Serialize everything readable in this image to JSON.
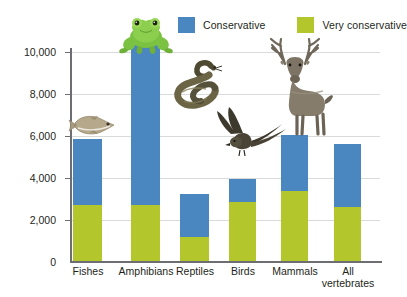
{
  "chart_data": {
    "type": "bar",
    "title": "",
    "subtitle": "",
    "xlabel": "",
    "ylabel": "Number of years",
    "ylim": [
      0,
      11000
    ],
    "yticks": [
      0,
      2000,
      4000,
      6000,
      8000,
      10000
    ],
    "ytick_labels": [
      "0",
      "2,000",
      "4,000",
      "6,000",
      "8,000",
      "10,000"
    ],
    "grid": true,
    "stacked": true,
    "legend_position": "top-right",
    "categories": [
      "Fishes",
      "Amphibians",
      "Reptiles",
      "Birds",
      "Mammals",
      "All vertebrates"
    ],
    "series": [
      {
        "name": "Very conservative",
        "color": "#b3c62c",
        "values": [
          2650,
          2650,
          1150,
          2800,
          3350,
          2550
        ]
      },
      {
        "name": "Conservative",
        "color": "#4a86c0",
        "values": [
          3150,
          7650,
          2050,
          1100,
          2650,
          3000
        ]
      }
    ],
    "totals": [
      5800,
      10300,
      3200,
      3900,
      6000,
      5550
    ],
    "annotations": [
      {
        "name": "fish-illustration",
        "category": "Fishes"
      },
      {
        "name": "frog-illustration",
        "category": "Amphibians"
      },
      {
        "name": "snake-illustration",
        "category": "Reptiles"
      },
      {
        "name": "bird-illustration",
        "category": "Birds"
      },
      {
        "name": "deer-illustration",
        "category": "Mammals"
      }
    ]
  },
  "legend": {
    "items": [
      {
        "label": "Conservative",
        "color": "#4a86c0",
        "swatch_name": "legend-swatch-conservative"
      },
      {
        "label": "Very conservative",
        "color": "#b3c62c",
        "swatch_name": "legend-swatch-very-conservative"
      }
    ]
  },
  "axes": {
    "y_title": "Number of years",
    "y_ticks": [
      "10,000",
      "8,000",
      "6,000",
      "4,000",
      "2,000",
      "0"
    ],
    "x_categories": [
      {
        "line1": "Fishes",
        "line2": ""
      },
      {
        "line1": "Amphibians",
        "line2": ""
      },
      {
        "line1": "Reptiles",
        "line2": ""
      },
      {
        "line1": "Birds",
        "line2": ""
      },
      {
        "line1": "Mammals",
        "line2": ""
      },
      {
        "line1": "All",
        "line2": "vertebrates"
      }
    ]
  },
  "colors": {
    "conservative": "#4a86c0",
    "very_conservative": "#b3c62c",
    "axis": "#6d6e71",
    "grid": "#d9dadb",
    "text": "#231f20",
    "background": "#ffffff"
  }
}
